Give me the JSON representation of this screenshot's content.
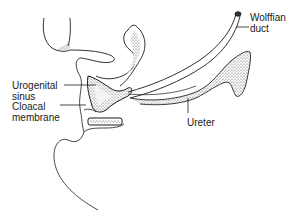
{
  "diagram": {
    "labels": {
      "wolffian_duct": {
        "line1": "Wolffian",
        "line2": "duct"
      },
      "urogenital_sinus": {
        "line1": "Urogenital",
        "line2": "sinus"
      },
      "cloacal_membrane": {
        "line1": "Cloacal",
        "line2": "membrane"
      },
      "ureter": {
        "line1": "Ureter"
      }
    },
    "colors": {
      "ink": "#1a1a1a",
      "background": "#ffffff",
      "stipple": "#555555"
    }
  }
}
